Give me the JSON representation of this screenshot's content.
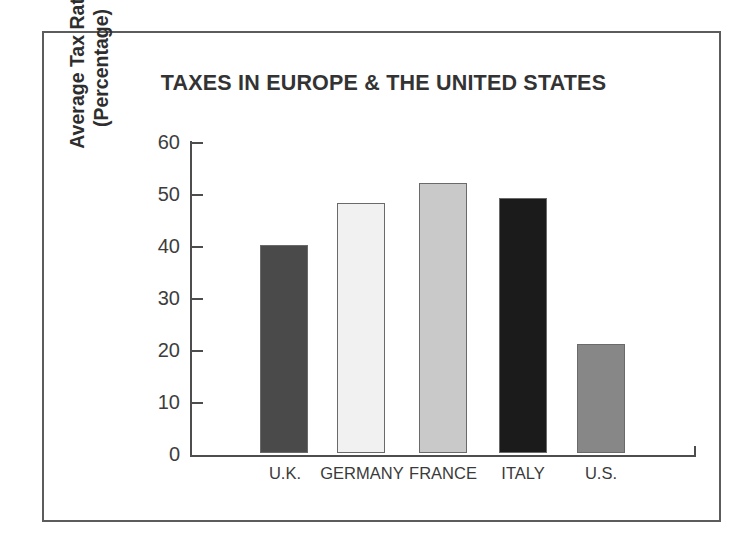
{
  "chart_data": {
    "type": "bar",
    "title": "TAXES IN EUROPE & THE UNITED STATES",
    "xlabel": "",
    "ylabel": "Average Tax Rate (Percentage)",
    "ylabel_lines": [
      "Average Tax Rate",
      "(Percentage)"
    ],
    "categories": [
      "U.K.",
      "GERMANY",
      "FRANCE",
      "ITALY",
      "U.S."
    ],
    "values": [
      40,
      48,
      52,
      49,
      21
    ],
    "ylim": [
      0,
      60
    ],
    "yticks": [
      60,
      50,
      40,
      30,
      20,
      10,
      0
    ],
    "grid": false,
    "legend": "none",
    "bar_colors": [
      "#4a4a4a",
      "#f1f1f1",
      "#c9c9c9",
      "#1b1b1b",
      "#878787"
    ],
    "bar_border_color": "#6a6a6a",
    "axis_color": "#4d4d4d",
    "frame_color": "#5c5c5c",
    "background": "#ffffff",
    "text_color": "#333333"
  }
}
